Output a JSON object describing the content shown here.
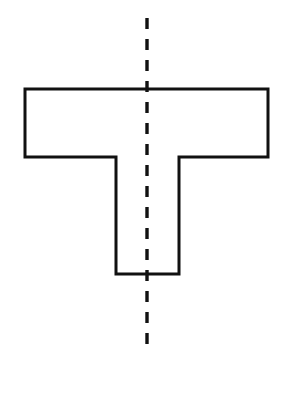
{
  "figure": {
    "caption": "A T-shaped (tee) outline drawn in black on a white background, bisected by a vertical dashed center line.",
    "background_color": "#ffffff",
    "outline_color": "#111111",
    "outline_width": 3,
    "dash_color": "#111111",
    "dash_width": 3.4,
    "canvas": {
      "width": 294,
      "height": 402
    }
  },
  "shape": {
    "name": "t-shape",
    "type": "polygon",
    "fill": "none",
    "stroke": "#111111",
    "stroke_width": 3,
    "vertices": [
      {
        "label": "top-left",
        "x": 25,
        "y": 89
      },
      {
        "label": "top-right",
        "x": 268,
        "y": 89
      },
      {
        "label": "right-flange-bottom",
        "x": 268,
        "y": 157
      },
      {
        "label": "right-inner-corner",
        "x": 179,
        "y": 157
      },
      {
        "label": "stem-bottom-right",
        "x": 179,
        "y": 274
      },
      {
        "label": "stem-bottom-left",
        "x": 116,
        "y": 274
      },
      {
        "label": "left-inner-corner",
        "x": 116,
        "y": 157
      },
      {
        "label": "left-flange-bottom",
        "x": 25,
        "y": 157
      }
    ],
    "measurements": {
      "flange_width": 243,
      "flange_height": 68,
      "stem_width": 63,
      "stem_height": 117,
      "total_height": 185
    }
  },
  "symmetry_axis": {
    "name": "vertical-center-line",
    "style": "dashed",
    "stroke": "#111111",
    "stroke_width": 3.4,
    "x": 147,
    "y_start": 18,
    "y_end": 350,
    "dash_length": 11,
    "gap_length": 10
  }
}
